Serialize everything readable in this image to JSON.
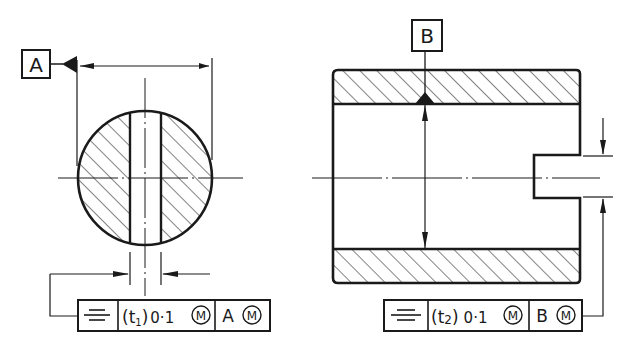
{
  "figure": {
    "type": "engineering-drawing",
    "topic": "symmetry tolerance with maximum material condition"
  },
  "left_view": {
    "datum_label": "A",
    "fcf": {
      "symbol": "symmetry",
      "tolerance_prefix": "(t",
      "tolerance_sub": "1",
      "tolerance_suffix": ")",
      "tolerance_value": "0·1",
      "modifier": "M",
      "datum": "A",
      "datum_modifier": "M"
    }
  },
  "right_view": {
    "datum_label": "B",
    "fcf": {
      "symbol": "symmetry",
      "tolerance_prefix": "(t",
      "tolerance_sub": "2",
      "tolerance_suffix": ")",
      "tolerance_value": "0·1",
      "modifier": "M",
      "datum": "B",
      "datum_modifier": "M"
    }
  },
  "colors": {
    "line": "#1a1a1a",
    "background": "#ffffff"
  }
}
